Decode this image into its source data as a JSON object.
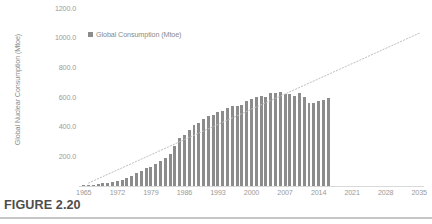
{
  "figure": {
    "caption": "FIGURE 2.20"
  },
  "legend": {
    "swatch_color": "#8c8c8c",
    "label": "Global Consumption (Mtoe)"
  },
  "chart_data": {
    "type": "bar",
    "title": "",
    "xlabel": "",
    "ylabel": "Global Nuclear Consumption (Mtoe)",
    "ylim": [
      0,
      1200
    ],
    "xlim": [
      1964,
      2036
    ],
    "ytick_labels": [
      "1200.0",
      "1000.0",
      "800.0",
      "600.0",
      "400.0",
      "200.0"
    ],
    "ytick_values": [
      1200,
      1000,
      800,
      600,
      400,
      200
    ],
    "xtick_labels": [
      "1965",
      "1972",
      "1979",
      "1986",
      "1993",
      "2000",
      "2007",
      "2014",
      "2021",
      "2028",
      "2035"
    ],
    "xtick_values": [
      1965,
      1972,
      1979,
      1986,
      1993,
      2000,
      2007,
      2014,
      2021,
      2028,
      2035
    ],
    "grid": false,
    "legend_position": "top-left-inside",
    "bar_color": "#8c8c8c",
    "series": [
      {
        "name": "Global Consumption (Mtoe)",
        "type": "bar",
        "x": [
          1965,
          1966,
          1967,
          1968,
          1969,
          1970,
          1971,
          1972,
          1973,
          1974,
          1975,
          1976,
          1977,
          1978,
          1979,
          1980,
          1981,
          1982,
          1983,
          1984,
          1985,
          1986,
          1987,
          1988,
          1989,
          1990,
          1991,
          1992,
          1993,
          1994,
          1995,
          1996,
          1997,
          1998,
          1999,
          2000,
          2001,
          2002,
          2003,
          2004,
          2005,
          2006,
          2007,
          2008,
          2009,
          2010,
          2011,
          2012,
          2013,
          2014,
          2015,
          2016
        ],
        "values": [
          6,
          8,
          10,
          13,
          17,
          20,
          26,
          33,
          43,
          52,
          70,
          85,
          102,
          120,
          128,
          146,
          172,
          187,
          217,
          267,
          323,
          346,
          381,
          412,
          425,
          450,
          471,
          479,
          498,
          504,
          523,
          542,
          542,
          546,
          572,
          584,
          601,
          610,
          597,
          624,
          627,
          635,
          622,
          619,
          610,
          626,
          600,
          560,
          563,
          574,
          583,
          592
        ]
      },
      {
        "name": "Trend (extrapolation)",
        "type": "line",
        "style": "dotted",
        "color": "#bfbfbf",
        "x": [
          1966,
          2035
        ],
        "values": [
          20,
          1030
        ]
      }
    ]
  }
}
